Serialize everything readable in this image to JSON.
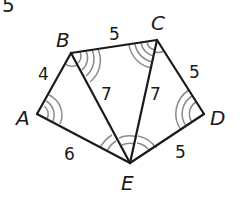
{
  "problem_number": "5",
  "vertices": [
    {
      "label": "A",
      "x": 37,
      "y": 114
    },
    {
      "label": "B",
      "x": 71,
      "y": 53
    },
    {
      "label": "C",
      "x": 157,
      "y": 40
    },
    {
      "label": "D",
      "x": 204,
      "y": 114
    },
    {
      "label": "E",
      "x": 130,
      "y": 163
    }
  ],
  "vertex_labels": {
    "A": "A",
    "B": "B",
    "C": "C",
    "D": "D",
    "E": "E"
  },
  "edges": [
    {
      "from": "A",
      "to": "B",
      "length": "4"
    },
    {
      "from": "B",
      "to": "C",
      "length": "5"
    },
    {
      "from": "C",
      "to": "D",
      "length": "5"
    },
    {
      "from": "D",
      "to": "E",
      "length": "5"
    },
    {
      "from": "E",
      "to": "A",
      "length": "6"
    },
    {
      "from": "B",
      "to": "E",
      "length": "7"
    },
    {
      "from": "C",
      "to": "E",
      "length": "7"
    }
  ],
  "edge_labels": {
    "AB": "4",
    "BC": "5",
    "CD": "5",
    "DE": "5",
    "EA": "6",
    "BE": "7",
    "CE": "7"
  },
  "colors": {
    "line": "#1a1a1a",
    "arc": "#8a8a8a",
    "background": "#ffffff"
  }
}
